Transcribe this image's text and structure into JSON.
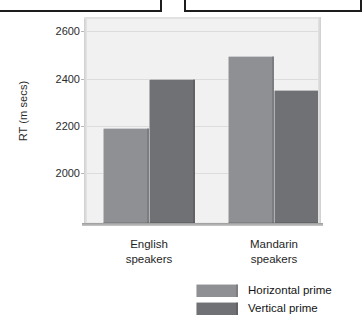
{
  "top_boxes": [
    {
      "name": "cropped-panel-left"
    },
    {
      "name": "cropped-panel-right"
    }
  ],
  "chart_data": {
    "type": "bar",
    "title": "",
    "xlabel": "",
    "ylabel": "RT (m secs)",
    "ylim": [
      1790,
      2660
    ],
    "yticks": [
      2000,
      2200,
      2400,
      2600
    ],
    "ytick_labels": [
      "2000",
      "2200",
      "2400",
      "2600"
    ],
    "grid": true,
    "legend_position": "bottom-right",
    "categories": [
      "English speakers",
      "Mandarin speakers"
    ],
    "category_lines": [
      [
        "English",
        "speakers"
      ],
      [
        "Mandarin",
        "speakers"
      ]
    ],
    "series": [
      {
        "name": "Horizontal prime",
        "color": "#8e9093",
        "values": [
          2190,
          2495
        ]
      },
      {
        "name": "Vertical prime",
        "color": "#6f7174",
        "values": [
          2400,
          2350
        ]
      }
    ]
  },
  "colors": {
    "plot_background": "#f1f1f1",
    "gridline": "#dcdcdc",
    "axis": "#9a9a9a",
    "text": "#1f1f1f"
  }
}
